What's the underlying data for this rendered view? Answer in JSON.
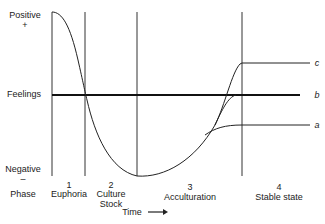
{
  "axis": {
    "positive": "Positive",
    "positive_sign": "+",
    "feelings": "Feelings",
    "negative": "Negative",
    "negative_sign": "–",
    "phase": "Phase",
    "time": "Time",
    "time_arrow": "→"
  },
  "phases": [
    {
      "number": "1",
      "name": "Euphoria",
      "name2": ""
    },
    {
      "number": "2",
      "name": "Culture",
      "name2": "Stock"
    },
    {
      "number": "3",
      "name": "Acculturation",
      "name2": ""
    },
    {
      "number": "4",
      "name": "Stable state",
      "name2": ""
    }
  ],
  "outcomes": {
    "c": "c",
    "b": "b",
    "a": "a"
  },
  "colors": {
    "line": "#222222",
    "baseline": "#111111"
  }
}
